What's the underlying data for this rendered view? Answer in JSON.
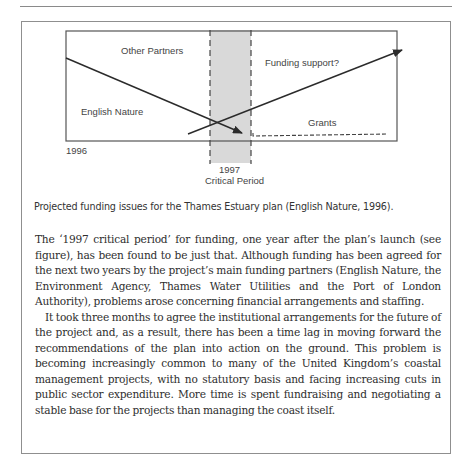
{
  "page": {
    "caption": "Projected funding issues for the Thames Estuary plan (English Nature, 1996).",
    "paragraphs": [
      "The ‘1997 critical period’ for funding, one year after the plan’s launch (see figure), has been found to be just that. Although funding has been agreed for the next two years by the project’s main funding partners (English Nature, the Environment Agency, Thames Water Utilities and the Port of London Authority), problems arose concerning financial arrangements and staffing.",
      "It took three months to agree the institutional arrangements for the future of the project and, as a result, there has been a time lag in moving forward the recommendations of the plan into action on the ground. This problem is becoming increasingly common to many of the United Kingdom’s coastal management projects, with no statutory basis and facing increasing cuts in public sector expenditure. More time is spent fundraising and negotiating a stable base for the projects than managing the coast itself."
    ]
  },
  "figure": {
    "labels": {
      "other_partners": "Other  Partners",
      "english_nature": "English Nature",
      "funding_support": "Funding support?",
      "grants": "Grants",
      "year_start": "1996",
      "year_critical": "1997",
      "critical_period": "Critical Period"
    },
    "colors": {
      "line": "#2b2b2b",
      "band": "#d9d9d9",
      "box": "#555555"
    }
  }
}
